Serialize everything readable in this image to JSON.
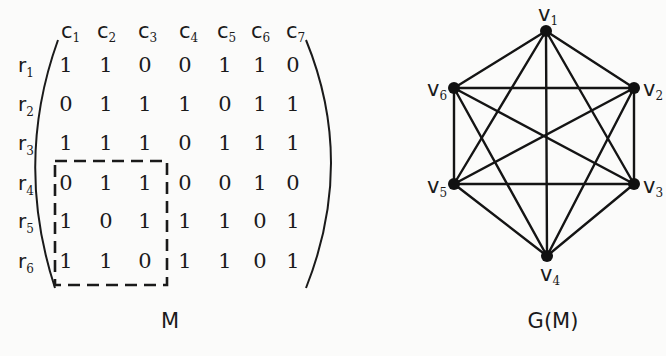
{
  "matrix": {
    "caption": "M",
    "column_labels": [
      {
        "base": "c",
        "sub": "1"
      },
      {
        "base": "c",
        "sub": "2"
      },
      {
        "base": "c",
        "sub": "3"
      },
      {
        "base": "c",
        "sub": "4"
      },
      {
        "base": "c",
        "sub": "5"
      },
      {
        "base": "c",
        "sub": "6"
      },
      {
        "base": "c",
        "sub": "7"
      }
    ],
    "row_labels": [
      {
        "base": "r",
        "sub": "1"
      },
      {
        "base": "r",
        "sub": "2"
      },
      {
        "base": "r",
        "sub": "3"
      },
      {
        "base": "r",
        "sub": "4"
      },
      {
        "base": "r",
        "sub": "5"
      },
      {
        "base": "r",
        "sub": "6"
      }
    ],
    "rows": [
      [
        "1",
        "1",
        "0",
        "0",
        "1",
        "1",
        "0"
      ],
      [
        "0",
        "1",
        "1",
        "1",
        "0",
        "1",
        "1"
      ],
      [
        "1",
        "1",
        "1",
        "0",
        "1",
        "1",
        "1"
      ],
      [
        "0",
        "1",
        "1",
        "0",
        "0",
        "1",
        "0"
      ],
      [
        "1",
        "0",
        "1",
        "1",
        "1",
        "0",
        "1"
      ],
      [
        "1",
        "1",
        "0",
        "1",
        "1",
        "0",
        "1"
      ]
    ],
    "highlighted_submatrix": {
      "rows": [
        4,
        6
      ],
      "cols": [
        1,
        3
      ],
      "style": "dashed-box"
    }
  },
  "graph": {
    "caption": "G(M)",
    "vertices": [
      {
        "id": "v1",
        "base": "v",
        "sub": "1"
      },
      {
        "id": "v2",
        "base": "v",
        "sub": "2"
      },
      {
        "id": "v3",
        "base": "v",
        "sub": "3"
      },
      {
        "id": "v4",
        "base": "v",
        "sub": "4"
      },
      {
        "id": "v5",
        "base": "v",
        "sub": "5"
      },
      {
        "id": "v6",
        "base": "v",
        "sub": "6"
      }
    ],
    "edges": [
      [
        "v1",
        "v2"
      ],
      [
        "v1",
        "v3"
      ],
      [
        "v1",
        "v4"
      ],
      [
        "v1",
        "v5"
      ],
      [
        "v1",
        "v6"
      ],
      [
        "v2",
        "v3"
      ],
      [
        "v2",
        "v4"
      ],
      [
        "v2",
        "v5"
      ],
      [
        "v2",
        "v6"
      ],
      [
        "v3",
        "v4"
      ],
      [
        "v3",
        "v5"
      ],
      [
        "v3",
        "v6"
      ],
      [
        "v4",
        "v5"
      ],
      [
        "v4",
        "v6"
      ],
      [
        "v5",
        "v6"
      ]
    ]
  }
}
